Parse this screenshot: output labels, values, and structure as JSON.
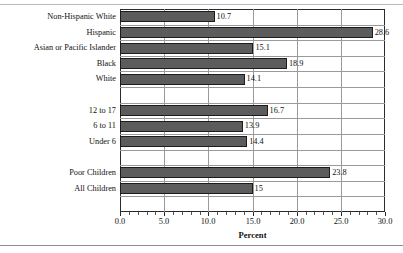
{
  "chart_data": {
    "type": "bar",
    "orientation": "horizontal",
    "title": "",
    "xlabel": "Percent",
    "ylabel": "",
    "xlim": [
      0.0,
      30.0
    ],
    "grid": true,
    "legend": false,
    "xticks": [
      "0.0",
      "5.0",
      "10.0",
      "15.0",
      "20.0",
      "25.0",
      "30.0"
    ],
    "xtick_values": [
      0.0,
      5.0,
      10.0,
      15.0,
      20.0,
      25.0,
      30.0
    ],
    "minor_tick_step": 1.0,
    "bar_color": "#5c5c5c",
    "bar_edge_color": "#1c1c1c",
    "grid_color": "#9a9a9a",
    "frame_color": "#2b2b2b",
    "rows": [
      {
        "label": "Non-Hispanic White",
        "value": 10.7,
        "value_text": "10.7",
        "spacer": false
      },
      {
        "label": "Hispanic",
        "value": 28.6,
        "value_text": "28.6",
        "spacer": false
      },
      {
        "label": "Asian or Pacific Islander",
        "value": 15.1,
        "value_text": "15.1",
        "spacer": false
      },
      {
        "label": "Black",
        "value": 18.9,
        "value_text": "18.9",
        "spacer": false
      },
      {
        "label": "White",
        "value": 14.1,
        "value_text": "14.1",
        "spacer": false
      },
      {
        "label": "",
        "value": null,
        "value_text": "",
        "spacer": true
      },
      {
        "label": "12 to 17",
        "value": 16.7,
        "value_text": "16.7",
        "spacer": false
      },
      {
        "label": "6 to 11",
        "value": 13.9,
        "value_text": "13.9",
        "spacer": false
      },
      {
        "label": "Under 6",
        "value": 14.4,
        "value_text": "14.4",
        "spacer": false
      },
      {
        "label": "",
        "value": null,
        "value_text": "",
        "spacer": true
      },
      {
        "label": "Poor Children",
        "value": 23.8,
        "value_text": "23.8",
        "spacer": false
      },
      {
        "label": "All Children",
        "value": 15.0,
        "value_text": "15",
        "spacer": false
      },
      {
        "label": "",
        "value": null,
        "value_text": "",
        "spacer": true
      }
    ],
    "categories": [
      "Non-Hispanic White",
      "Hispanic",
      "Asian or Pacific Islander",
      "Black",
      "White",
      "12 to 17",
      "6 to 11",
      "Under 6",
      "Poor Children",
      "All Children"
    ],
    "values": [
      10.7,
      28.6,
      15.1,
      18.9,
      14.1,
      16.7,
      13.9,
      14.4,
      23.8,
      15.0
    ]
  }
}
